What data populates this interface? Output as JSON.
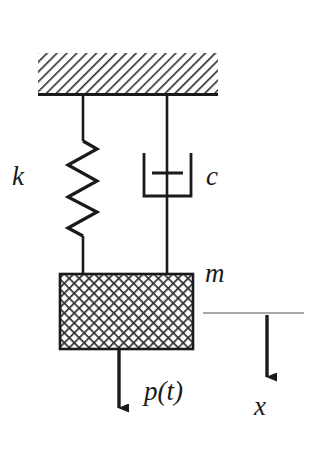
{
  "diagram": {
    "background_color": "#ffffff",
    "stroke_color": "#1a1a1a",
    "hatch_color": "#2b2b2b",
    "reference_line_color": "#8a8a8a",
    "labels": {
      "spring_stiffness": "k",
      "damping_coefficient": "c",
      "mass": "m",
      "applied_force": "p(t)",
      "displacement": "x"
    },
    "components": {
      "ceiling": {
        "name": "fixed-support",
        "hatch_pattern": "diagonal-45",
        "x": 38,
        "y": 53,
        "width": 180,
        "height": 42
      },
      "spring": {
        "name": "coil-spring",
        "coils": 6,
        "top_x": 83,
        "top_y": 95,
        "zigzag_top_y": 141,
        "zigzag_bottom_y": 236,
        "bottom_y": 274,
        "amplitude": 15
      },
      "damper": {
        "name": "viscous-dashpot",
        "top_x": 167,
        "top_y": 95,
        "cylinder_left": 143,
        "cylinder_right": 192,
        "cylinder_top": 153,
        "cylinder_bottom": 197,
        "piston_y": 173,
        "piston_left": 152,
        "piston_right": 183,
        "bottom_y": 274
      },
      "mass_block": {
        "name": "mass-block",
        "hatch_pattern": "cross-hatch",
        "x": 60,
        "y": 274,
        "width": 133,
        "height": 75
      },
      "force_arrow": {
        "name": "applied-force-arrow",
        "x": 119,
        "y_start": 349,
        "y_end": 419,
        "direction": "down"
      },
      "displacement_arrow": {
        "name": "displacement-arrow",
        "x": 267,
        "y_start": 315,
        "y_end": 388,
        "direction": "down"
      },
      "reference_line": {
        "name": "datum-reference-line",
        "x_start": 203,
        "x_end": 304,
        "y": 313
      }
    }
  }
}
